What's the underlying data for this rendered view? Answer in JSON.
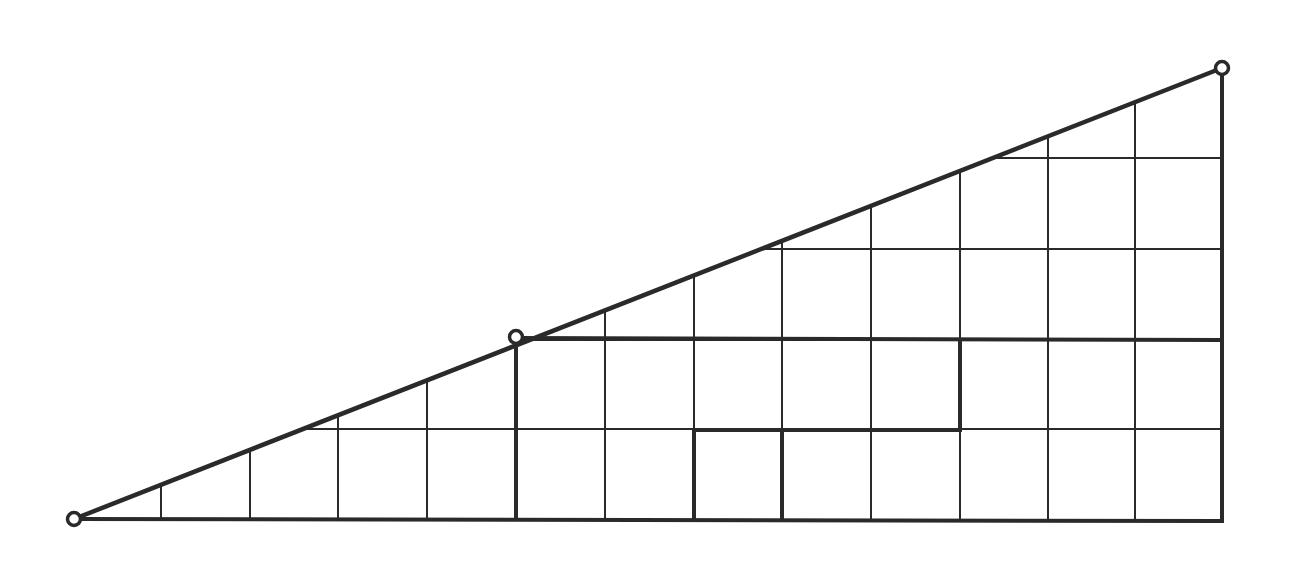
{
  "diagram": {
    "colors": {
      "stroke": "#2a2a2a",
      "background": "#ffffff"
    },
    "points": [
      {
        "name": "bottom-left-vertex",
        "x": 74,
        "y": 519
      },
      {
        "name": "midpoint-vertex",
        "x": 516,
        "y": 337
      },
      {
        "name": "top-right-vertex",
        "x": 1222,
        "y": 68
      }
    ],
    "grid": {
      "vertical_x": [
        161,
        250,
        338,
        427,
        516,
        605,
        694,
        782,
        871,
        960,
        1048,
        1135,
        1222
      ],
      "horizontal_y": [
        429,
        340,
        249,
        158
      ],
      "baseline_y": 519,
      "columns": 13,
      "rows": 5
    },
    "bold_segments": [
      {
        "x1": 74,
        "y1": 519,
        "x2": 1222,
        "y2": 521
      },
      {
        "x1": 1222,
        "y1": 68,
        "x2": 1222,
        "y2": 521
      },
      {
        "x1": 516,
        "y1": 337,
        "x2": 516,
        "y2": 519
      },
      {
        "x1": 516,
        "y1": 338,
        "x2": 1222,
        "y2": 340
      },
      {
        "x1": 694,
        "y1": 430,
        "x2": 960,
        "y2": 430
      },
      {
        "x1": 960,
        "y1": 340,
        "x2": 960,
        "y2": 430
      },
      {
        "x1": 694,
        "y1": 430,
        "x2": 694,
        "y2": 519
      },
      {
        "x1": 782,
        "y1": 430,
        "x2": 782,
        "y2": 519
      }
    ]
  }
}
